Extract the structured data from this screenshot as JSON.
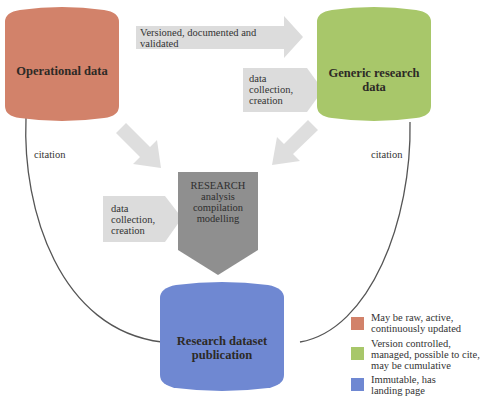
{
  "nodes": {
    "operational": {
      "label": "Operational data",
      "color": "#d2826a"
    },
    "generic": {
      "label": "Generic research data",
      "color": "#a8c76a"
    },
    "publication": {
      "label": "Research dataset publication",
      "color": "#6f88d2"
    },
    "research": {
      "lines": [
        "RESEARCH",
        "analysis",
        "compilation",
        "modelling"
      ],
      "color": "#8f8f8f"
    }
  },
  "arrows": {
    "top": {
      "label_line1": "Versioned, documented and",
      "label_line2": "validated"
    },
    "right_input": {
      "lines": [
        "data",
        "collection,",
        "creation"
      ]
    },
    "left_input": {
      "lines": [
        "data",
        "collection,",
        "creation"
      ]
    }
  },
  "edges": {
    "left_citation": "citation",
    "right_citation": "citation"
  },
  "legend": [
    {
      "color": "#d2826a",
      "lines": [
        "May be raw, active,",
        "continuously updated"
      ]
    },
    {
      "color": "#a8c76a",
      "lines": [
        "Version controlled,",
        "managed, possible to cite,",
        "may be cumulative"
      ]
    },
    {
      "color": "#6f88d2",
      "lines": [
        "Immutable, has",
        "landing page"
      ]
    }
  ]
}
